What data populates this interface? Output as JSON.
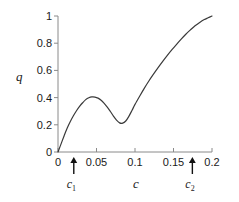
{
  "chart_data": {
    "type": "line",
    "title": "",
    "xlabel": "c",
    "ylabel": "q",
    "xlim": [
      0,
      0.2
    ],
    "ylim": [
      0,
      1
    ],
    "grid": false,
    "legend": "none",
    "x_ticks": [
      0,
      0.05,
      0.1,
      0.15,
      0.2
    ],
    "x_tick_labels": [
      "0",
      "0.05",
      "0.1",
      "0.15",
      "0.2"
    ],
    "y_ticks": [
      0,
      0.2,
      0.4,
      0.6,
      0.8,
      1
    ],
    "y_tick_labels": [
      "0",
      "0.2",
      "0.4",
      "0.6",
      "0.8",
      "1"
    ],
    "line_color": "#3a3a3a",
    "axis_color": "#8a8a8a",
    "series": [
      {
        "name": "q(c)",
        "x": [
          0.0,
          0.004,
          0.008,
          0.012,
          0.016,
          0.02,
          0.024,
          0.028,
          0.032,
          0.036,
          0.04,
          0.044,
          0.048,
          0.052,
          0.056,
          0.06,
          0.064,
          0.068,
          0.072,
          0.076,
          0.08,
          0.084,
          0.088,
          0.092,
          0.096,
          0.1,
          0.106,
          0.112,
          0.118,
          0.124,
          0.13,
          0.136,
          0.142,
          0.148,
          0.154,
          0.16,
          0.166,
          0.172,
          0.178,
          0.184,
          0.19,
          0.195,
          0.2
        ],
        "y": [
          0.0,
          0.06,
          0.12,
          0.176,
          0.224,
          0.266,
          0.303,
          0.335,
          0.362,
          0.385,
          0.399,
          0.405,
          0.404,
          0.396,
          0.381,
          0.358,
          0.33,
          0.298,
          0.264,
          0.234,
          0.214,
          0.212,
          0.228,
          0.262,
          0.305,
          0.35,
          0.41,
          0.468,
          0.522,
          0.572,
          0.62,
          0.666,
          0.71,
          0.752,
          0.792,
          0.83,
          0.866,
          0.898,
          0.928,
          0.953,
          0.974,
          0.987,
          1.0
        ]
      }
    ],
    "annotations": [
      {
        "name": "c1",
        "label": "c",
        "sub": "1",
        "x": 0.0205,
        "type": "up-arrow"
      },
      {
        "name": "c2",
        "label": "c",
        "sub": "2",
        "x": 0.1745,
        "type": "up-arrow"
      }
    ]
  }
}
